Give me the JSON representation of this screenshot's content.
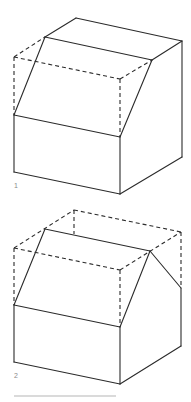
{
  "figures": [
    {
      "label": "1",
      "description": "Box with single sloped (lean-to / shed) roof cut from a cuboid; dashed lines show the removed volume",
      "solid_lines": [
        [
          [
            45,
            37
          ],
          [
            76,
            18
          ]
        ],
        [
          [
            76,
            18
          ],
          [
            182,
            41
          ]
        ],
        [
          [
            182,
            41
          ],
          [
            152,
            60
          ]
        ],
        [
          [
            45,
            37
          ],
          [
            152,
            60
          ]
        ],
        [
          [
            45,
            37
          ],
          [
            14,
            115
          ]
        ],
        [
          [
            152,
            60
          ],
          [
            120,
            137
          ]
        ],
        [
          [
            14,
            115
          ],
          [
            120,
            137
          ]
        ],
        [
          [
            14,
            115
          ],
          [
            14,
            172
          ]
        ],
        [
          [
            120,
            137
          ],
          [
            120,
            194
          ]
        ],
        [
          [
            14,
            172
          ],
          [
            120,
            194
          ]
        ],
        [
          [
            120,
            194
          ],
          [
            182,
            157
          ]
        ],
        [
          [
            182,
            41
          ],
          [
            182,
            157
          ]
        ]
      ],
      "dashed_lines": [
        [
          [
            14,
            57
          ],
          [
            45,
            37
          ]
        ],
        [
          [
            14,
            57
          ],
          [
            120,
            79
          ]
        ],
        [
          [
            120,
            79
          ],
          [
            152,
            60
          ]
        ],
        [
          [
            14,
            57
          ],
          [
            14,
            115
          ]
        ],
        [
          [
            120,
            79
          ],
          [
            120,
            137
          ]
        ]
      ],
      "label_pos": [
        14,
        188
      ]
    },
    {
      "label": "2",
      "description": "Box with gable (pitched) roof cut from a cuboid; dashed lines show the removed volume",
      "solid_lines": [
        [
          [
            45,
            229
          ],
          [
            150,
            251
          ]
        ],
        [
          [
            45,
            229
          ],
          [
            14,
            305
          ]
        ],
        [
          [
            150,
            251
          ],
          [
            120,
            327
          ]
        ],
        [
          [
            150,
            251
          ],
          [
            181,
            288
          ]
        ],
        [
          [
            14,
            305
          ],
          [
            120,
            327
          ]
        ],
        [
          [
            14,
            305
          ],
          [
            14,
            362
          ]
        ],
        [
          [
            120,
            327
          ],
          [
            120,
            384
          ]
        ],
        [
          [
            14,
            362
          ],
          [
            120,
            384
          ]
        ],
        [
          [
            120,
            384
          ],
          [
            181,
            346
          ]
        ],
        [
          [
            181,
            288
          ],
          [
            181,
            346
          ]
        ]
      ],
      "dashed_lines": [
        [
          [
            14,
            248
          ],
          [
            74,
            210
          ]
        ],
        [
          [
            74,
            210
          ],
          [
            181,
            232
          ]
        ],
        [
          [
            14,
            248
          ],
          [
            120,
            270
          ]
        ],
        [
          [
            120,
            270
          ],
          [
            181,
            232
          ]
        ],
        [
          [
            14,
            248
          ],
          [
            14,
            305
          ]
        ],
        [
          [
            120,
            270
          ],
          [
            120,
            327
          ]
        ],
        [
          [
            181,
            232
          ],
          [
            181,
            288
          ]
        ],
        [
          [
            74,
            210
          ],
          [
            74,
            234
          ]
        ]
      ],
      "label_pos": [
        14,
        378
      ]
    }
  ],
  "rule": {
    "x1": 14,
    "x2": 116,
    "y": 396,
    "color": "#b5b5b5"
  },
  "colors": {
    "line": "#2b2b2b",
    "label": "#8a8a8a",
    "background": "#ffffff"
  }
}
